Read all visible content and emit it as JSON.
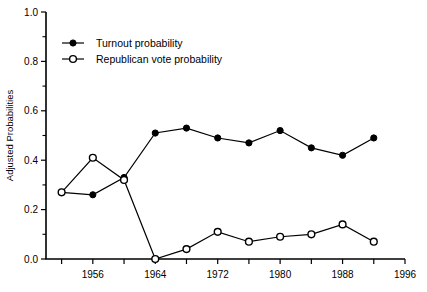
{
  "chart_data": {
    "type": "line",
    "title": "",
    "xlabel": "",
    "ylabel": "Adjusted Probabilities",
    "xlim": [
      1950,
      1996
    ],
    "ylim": [
      0.0,
      1.0
    ],
    "grid": false,
    "legend_position": "top-left",
    "x": [
      1952,
      1956,
      1960,
      1964,
      1968,
      1972,
      1976,
      1980,
      1984,
      1988,
      1992
    ],
    "xticks": [
      1952,
      1956,
      1960,
      1964,
      1968,
      1972,
      1976,
      1980,
      1984,
      1988,
      1992,
      1996
    ],
    "xtick_labels": [
      "",
      "1956",
      "",
      "1964",
      "",
      "1972",
      "",
      "1980",
      "",
      "1988",
      "",
      "1996"
    ],
    "yticks": [
      0.0,
      0.2,
      0.4,
      0.6,
      0.8,
      1.0
    ],
    "ytick_labels": [
      "0.0",
      "0.2",
      "0.4",
      "0.6",
      "0.8",
      "1.0"
    ],
    "yticks_minor": [
      0.1,
      0.3,
      0.5,
      0.7,
      0.9
    ],
    "series": [
      {
        "name": "Turnout probability",
        "marker": "filled-circle",
        "values": [
          0.27,
          0.26,
          0.33,
          0.51,
          0.53,
          0.49,
          0.47,
          0.52,
          0.45,
          0.42,
          0.49
        ]
      },
      {
        "name": "Republican vote probability",
        "marker": "open-circle",
        "values": [
          0.27,
          0.41,
          0.32,
          0.0,
          0.04,
          0.11,
          0.07,
          0.09,
          0.1,
          0.14,
          0.07
        ]
      }
    ]
  },
  "legend": {
    "items": [
      {
        "label": "Turnout probability",
        "marker": "filled-circle"
      },
      {
        "label": "Republican vote probability",
        "marker": "open-circle"
      }
    ]
  },
  "axes": {
    "y_title": "Adjusted Probabilities"
  }
}
